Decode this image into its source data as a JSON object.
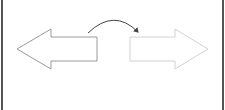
{
  "diagram": {
    "colors": {
      "background": "#ffffff",
      "border": "#555555",
      "left_arrow_stroke": "#9a9a9a",
      "right_arrow_stroke": "#d2d2d2",
      "curve_stroke": "#444444"
    },
    "left_arrow": {
      "direction": "left",
      "style": "outlined"
    },
    "right_arrow": {
      "direction": "right",
      "style": "outlined-faded"
    },
    "curved_arrow": {
      "direction": "left-to-right",
      "style": "arc"
    }
  }
}
